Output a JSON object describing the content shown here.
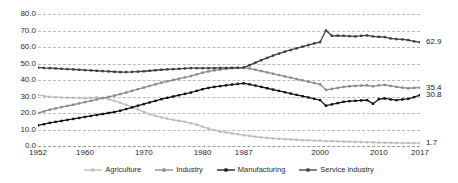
{
  "chart_data": {
    "type": "line",
    "title": "",
    "xlabel": "",
    "ylabel": "",
    "ylim": [
      0,
      80
    ],
    "y_ticks": [
      "0.0",
      "10.0",
      "20.0",
      "30.0",
      "40.0",
      "50.0",
      "60.0",
      "70.0",
      "80.0"
    ],
    "x_tick_labels": [
      "1952",
      "1960",
      "1970",
      "1980",
      "1987",
      "2000",
      "2010",
      "2017"
    ],
    "x_start": 1952,
    "x_end": 2017,
    "grid": true,
    "legend_position": "bottom",
    "markers": true,
    "end_labels": {
      "service_industry": "62.9",
      "industry": "35.4",
      "manufacturing": "30.8",
      "agriculture": "1.7"
    },
    "colors": {
      "agriculture": "#bdbdbd",
      "industry": "#8a8a8a",
      "manufacturing": "#141414",
      "service_industry": "#3d3d3d"
    },
    "x": [
      1952,
      1953,
      1954,
      1955,
      1956,
      1957,
      1958,
      1959,
      1960,
      1961,
      1962,
      1963,
      1964,
      1965,
      1966,
      1967,
      1968,
      1969,
      1970,
      1971,
      1972,
      1973,
      1974,
      1975,
      1976,
      1977,
      1978,
      1979,
      1980,
      1981,
      1982,
      1983,
      1984,
      1985,
      1986,
      1987,
      1988,
      1989,
      1990,
      1991,
      1992,
      1993,
      1994,
      1995,
      1996,
      1997,
      1998,
      1999,
      2000,
      2001,
      2002,
      2003,
      2004,
      2005,
      2006,
      2007,
      2008,
      2009,
      2010,
      2011,
      2012,
      2013,
      2014,
      2015,
      2016,
      2017
    ],
    "series": [
      {
        "name": "Agriculture",
        "values": [
          31.0,
          30.4,
          29.8,
          29.6,
          29.4,
          29.3,
          29.2,
          29.2,
          29.1,
          29.2,
          29.4,
          29.2,
          28.4,
          27.4,
          26.2,
          25.0,
          23.6,
          22.2,
          20.6,
          19.3,
          18.2,
          17.3,
          16.6,
          15.9,
          15.3,
          14.6,
          13.8,
          12.9,
          11.7,
          10.6,
          9.6,
          8.7,
          8.2,
          7.7,
          7.2,
          6.5,
          6.1,
          5.6,
          5.2,
          4.9,
          4.6,
          4.4,
          4.2,
          4.0,
          3.8,
          3.6,
          3.5,
          3.3,
          3.2,
          3.0,
          2.9,
          2.8,
          2.7,
          2.6,
          2.5,
          2.4,
          2.3,
          2.2,
          2.1,
          2.0,
          1.9,
          1.9,
          1.8,
          1.8,
          1.8,
          1.7
        ],
        "color": "#bdbdbd"
      },
      {
        "name": "Industry",
        "values": [
          20.0,
          21.0,
          22.0,
          22.8,
          23.6,
          24.3,
          25.0,
          25.8,
          26.6,
          27.4,
          28.2,
          29.0,
          29.8,
          30.6,
          31.5,
          32.4,
          33.4,
          34.4,
          35.4,
          36.4,
          37.4,
          38.4,
          39.2,
          40.0,
          40.8,
          41.6,
          42.4,
          43.4,
          44.4,
          45.2,
          45.8,
          46.3,
          46.8,
          47.1,
          47.3,
          47.5,
          47.0,
          46.2,
          45.4,
          44.6,
          43.8,
          43.0,
          42.2,
          41.4,
          40.6,
          39.8,
          39.0,
          38.2,
          37.4,
          34.0,
          34.6,
          35.2,
          35.8,
          36.2,
          36.4,
          36.6,
          36.8,
          36.2,
          36.8,
          37.0,
          36.4,
          35.8,
          35.4,
          35.0,
          35.2,
          35.4
        ],
        "color": "#8a8a8a"
      },
      {
        "name": "Manufacturing",
        "values": [
          12.5,
          13.2,
          14.0,
          14.6,
          15.2,
          15.8,
          16.4,
          17.0,
          17.6,
          18.2,
          18.8,
          19.4,
          20.0,
          20.6,
          21.4,
          22.4,
          23.4,
          24.4,
          25.4,
          26.4,
          27.4,
          28.4,
          29.2,
          30.0,
          30.8,
          31.6,
          32.4,
          33.4,
          34.4,
          35.2,
          35.8,
          36.3,
          36.8,
          37.2,
          37.6,
          38.0,
          37.4,
          36.6,
          35.8,
          35.0,
          34.2,
          33.4,
          32.6,
          31.8,
          31.0,
          30.2,
          29.4,
          28.6,
          27.8,
          24.4,
          25.2,
          26.0,
          26.8,
          27.2,
          27.4,
          27.6,
          27.8,
          25.6,
          28.4,
          28.8,
          28.2,
          27.8,
          28.2,
          28.6,
          29.6,
          30.8
        ],
        "color": "#141414"
      },
      {
        "name": "Service industry",
        "values": [
          47.5,
          47.3,
          47.2,
          47.0,
          46.8,
          46.6,
          46.4,
          46.2,
          46.0,
          45.8,
          45.6,
          45.4,
          45.2,
          45.0,
          44.8,
          44.8,
          44.9,
          45.1,
          45.3,
          45.6,
          45.9,
          46.2,
          46.4,
          46.6,
          46.8,
          47.0,
          47.2,
          47.2,
          47.2,
          47.2,
          47.2,
          47.3,
          47.3,
          47.4,
          47.4,
          47.5,
          49.0,
          50.5,
          52.0,
          53.4,
          54.8,
          56.0,
          57.2,
          58.2,
          59.2,
          60.2,
          61.2,
          62.2,
          63.0,
          70.0,
          66.8,
          66.9,
          66.8,
          66.6,
          66.4,
          66.8,
          67.0,
          66.4,
          66.2,
          66.0,
          65.2,
          64.8,
          64.6,
          64.2,
          63.4,
          62.9
        ],
        "color": "#3d3d3d"
      }
    ]
  },
  "legend": {
    "items": [
      {
        "label": "Agriculture",
        "color": "#bdbdbd"
      },
      {
        "label": "Industry",
        "color": "#8a8a8a"
      },
      {
        "label": "Manufacturing",
        "color": "#141414"
      },
      {
        "label": "Service industry",
        "color": "#3d3d3d"
      }
    ]
  }
}
